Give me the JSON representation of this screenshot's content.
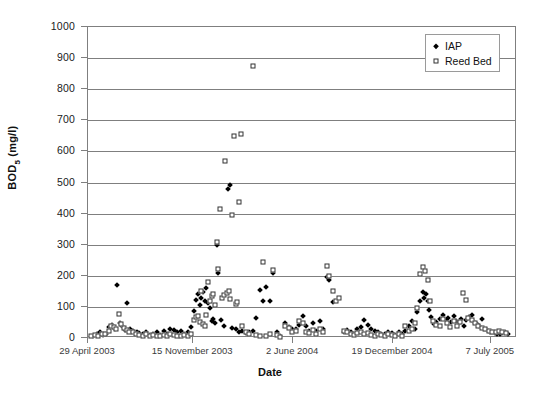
{
  "chart_data": {
    "type": "scatter",
    "title": "",
    "xlabel": "Date",
    "ylabel": "BOD5 (mg/l)",
    "ylabel_base": "BOD",
    "ylabel_sub": "5",
    "ylabel_units": " (mg/l)",
    "grid": true,
    "legend_position": "top-right",
    "ylim": [
      0,
      1000
    ],
    "ytick_step": 100,
    "yticks": [
      0,
      100,
      200,
      300,
      400,
      500,
      600,
      700,
      800,
      900,
      1000
    ],
    "xticks": [
      "29 April 2003",
      "15 November 2003",
      "2 June 2004",
      "19 December 2004",
      "7 July 2005"
    ],
    "xtick_positions": [
      0,
      0.245,
      0.478,
      0.711,
      0.939
    ],
    "xlim_labels": [
      "29 April 2003",
      "7 July 2005"
    ],
    "series": [
      {
        "name": "IAP",
        "marker": "filled-diamond",
        "color": "#000000",
        "points": [
          [
            0.012,
            8
          ],
          [
            0.02,
            14
          ],
          [
            0.028,
            20
          ],
          [
            0.034,
            10
          ],
          [
            0.042,
            12
          ],
          [
            0.05,
            35
          ],
          [
            0.056,
            42
          ],
          [
            0.062,
            30
          ],
          [
            0.068,
            172
          ],
          [
            0.074,
            48
          ],
          [
            0.08,
            38
          ],
          [
            0.086,
            25
          ],
          [
            0.092,
            112
          ],
          [
            0.098,
            28
          ],
          [
            0.106,
            22
          ],
          [
            0.114,
            18
          ],
          [
            0.12,
            15
          ],
          [
            0.128,
            12
          ],
          [
            0.136,
            20
          ],
          [
            0.144,
            10
          ],
          [
            0.152,
            14
          ],
          [
            0.16,
            18
          ],
          [
            0.168,
            9
          ],
          [
            0.176,
            22
          ],
          [
            0.184,
            12
          ],
          [
            0.192,
            30
          ],
          [
            0.2,
            25
          ],
          [
            0.208,
            18
          ],
          [
            0.216,
            22
          ],
          [
            0.224,
            14
          ],
          [
            0.232,
            20
          ],
          [
            0.24,
            35
          ],
          [
            0.248,
            88
          ],
          [
            0.252,
            122
          ],
          [
            0.256,
            140
          ],
          [
            0.26,
            105
          ],
          [
            0.264,
            128
          ],
          [
            0.268,
            148
          ],
          [
            0.272,
            118
          ],
          [
            0.276,
            160
          ],
          [
            0.28,
            112
          ],
          [
            0.284,
            95
          ],
          [
            0.288,
            55
          ],
          [
            0.292,
            62
          ],
          [
            0.296,
            48
          ],
          [
            0.3,
            300
          ],
          [
            0.304,
            210
          ],
          [
            0.31,
            58
          ],
          [
            0.318,
            40
          ],
          [
            0.326,
            480
          ],
          [
            0.33,
            492
          ],
          [
            0.336,
            32
          ],
          [
            0.344,
            28
          ],
          [
            0.352,
            20
          ],
          [
            0.36,
            24
          ],
          [
            0.368,
            15
          ],
          [
            0.376,
            18
          ],
          [
            0.384,
            22
          ],
          [
            0.392,
            65
          ],
          [
            0.4,
            155
          ],
          [
            0.408,
            120
          ],
          [
            0.416,
            165
          ],
          [
            0.424,
            118
          ],
          [
            0.432,
            208
          ],
          [
            0.44,
            20
          ],
          [
            0.448,
            5
          ],
          [
            0.46,
            48
          ],
          [
            0.468,
            35
          ],
          [
            0.476,
            28
          ],
          [
            0.484,
            30
          ],
          [
            0.492,
            42
          ],
          [
            0.5,
            72
          ],
          [
            0.508,
            38
          ],
          [
            0.516,
            22
          ],
          [
            0.524,
            48
          ],
          [
            0.532,
            24
          ],
          [
            0.54,
            55
          ],
          [
            0.548,
            30
          ],
          [
            0.556,
            195
          ],
          [
            0.562,
            188
          ],
          [
            0.57,
            115
          ],
          [
            0.596,
            18
          ],
          [
            0.604,
            25
          ],
          [
            0.612,
            20
          ],
          [
            0.62,
            14
          ],
          [
            0.628,
            30
          ],
          [
            0.636,
            35
          ],
          [
            0.644,
            58
          ],
          [
            0.652,
            42
          ],
          [
            0.66,
            28
          ],
          [
            0.668,
            22
          ],
          [
            0.676,
            18
          ],
          [
            0.684,
            14
          ],
          [
            0.692,
            12
          ],
          [
            0.7,
            20
          ],
          [
            0.708,
            16
          ],
          [
            0.716,
            10
          ],
          [
            0.724,
            18
          ],
          [
            0.732,
            14
          ],
          [
            0.74,
            22
          ],
          [
            0.748,
            38
          ],
          [
            0.756,
            55
          ],
          [
            0.762,
            30
          ],
          [
            0.768,
            82
          ],
          [
            0.774,
            118
          ],
          [
            0.78,
            148
          ],
          [
            0.784,
            130
          ],
          [
            0.788,
            142
          ],
          [
            0.792,
            120
          ],
          [
            0.796,
            90
          ],
          [
            0.8,
            68
          ],
          [
            0.806,
            45
          ],
          [
            0.812,
            52
          ],
          [
            0.82,
            62
          ],
          [
            0.828,
            75
          ],
          [
            0.834,
            58
          ],
          [
            0.84,
            65
          ],
          [
            0.846,
            50
          ],
          [
            0.852,
            72
          ],
          [
            0.858,
            55
          ],
          [
            0.864,
            48
          ],
          [
            0.87,
            62
          ],
          [
            0.876,
            40
          ],
          [
            0.882,
            58
          ],
          [
            0.888,
            68
          ],
          [
            0.894,
            75
          ],
          [
            0.9,
            52
          ],
          [
            0.906,
            45
          ],
          [
            0.912,
            38
          ],
          [
            0.918,
            62
          ],
          [
            0.924,
            30
          ],
          [
            0.93,
            25
          ],
          [
            0.936,
            20
          ],
          [
            0.942,
            18
          ],
          [
            0.948,
            16
          ],
          [
            0.954,
            14
          ],
          [
            0.96,
            12
          ],
          [
            0.966,
            15
          ],
          [
            0.972,
            18
          ],
          [
            0.978,
            14
          ]
        ]
      },
      {
        "name": "Reed Bed",
        "marker": "open-square",
        "color": "#333333",
        "points": [
          [
            0.008,
            6
          ],
          [
            0.016,
            10
          ],
          [
            0.024,
            8
          ],
          [
            0.032,
            14
          ],
          [
            0.04,
            12
          ],
          [
            0.048,
            22
          ],
          [
            0.054,
            40
          ],
          [
            0.06,
            35
          ],
          [
            0.066,
            28
          ],
          [
            0.072,
            78
          ],
          [
            0.078,
            45
          ],
          [
            0.084,
            32
          ],
          [
            0.09,
            25
          ],
          [
            0.096,
            20
          ],
          [
            0.104,
            18
          ],
          [
            0.112,
            14
          ],
          [
            0.12,
            10
          ],
          [
            0.128,
            8
          ],
          [
            0.136,
            12
          ],
          [
            0.144,
            6
          ],
          [
            0.152,
            9
          ],
          [
            0.16,
            7
          ],
          [
            0.168,
            5
          ],
          [
            0.176,
            10
          ],
          [
            0.184,
            8
          ],
          [
            0.192,
            12
          ],
          [
            0.2,
            9
          ],
          [
            0.208,
            7
          ],
          [
            0.216,
            6
          ],
          [
            0.224,
            10
          ],
          [
            0.232,
            8
          ],
          [
            0.24,
            14
          ],
          [
            0.248,
            58
          ],
          [
            0.252,
            68
          ],
          [
            0.256,
            72
          ],
          [
            0.26,
            52
          ],
          [
            0.264,
            150
          ],
          [
            0.268,
            45
          ],
          [
            0.272,
            40
          ],
          [
            0.276,
            75
          ],
          [
            0.28,
            180
          ],
          [
            0.284,
            118
          ],
          [
            0.288,
            135
          ],
          [
            0.292,
            142
          ],
          [
            0.296,
            105
          ],
          [
            0.3,
            310
          ],
          [
            0.304,
            222
          ],
          [
            0.308,
            415
          ],
          [
            0.312,
            128
          ],
          [
            0.316,
            138
          ],
          [
            0.32,
            570
          ],
          [
            0.324,
            145
          ],
          [
            0.328,
            152
          ],
          [
            0.332,
            125
          ],
          [
            0.336,
            395
          ],
          [
            0.34,
            650
          ],
          [
            0.344,
            108
          ],
          [
            0.348,
            115
          ],
          [
            0.352,
            436
          ],
          [
            0.356,
            655
          ],
          [
            0.36,
            40
          ],
          [
            0.368,
            18
          ],
          [
            0.376,
            12
          ],
          [
            0.384,
            875
          ],
          [
            0.392,
            10
          ],
          [
            0.4,
            8
          ],
          [
            0.408,
            245
          ],
          [
            0.416,
            6
          ],
          [
            0.424,
            12
          ],
          [
            0.432,
            218
          ],
          [
            0.44,
            10
          ],
          [
            0.448,
            4
          ],
          [
            0.46,
            38
          ],
          [
            0.468,
            32
          ],
          [
            0.476,
            20
          ],
          [
            0.484,
            22
          ],
          [
            0.492,
            55
          ],
          [
            0.5,
            48
          ],
          [
            0.508,
            18
          ],
          [
            0.516,
            15
          ],
          [
            0.524,
            25
          ],
          [
            0.532,
            12
          ],
          [
            0.54,
            30
          ],
          [
            0.548,
            20
          ],
          [
            0.556,
            232
          ],
          [
            0.562,
            200
          ],
          [
            0.57,
            152
          ],
          [
            0.578,
            118
          ],
          [
            0.586,
            128
          ],
          [
            0.596,
            22
          ],
          [
            0.604,
            18
          ],
          [
            0.612,
            14
          ],
          [
            0.62,
            10
          ],
          [
            0.628,
            16
          ],
          [
            0.636,
            20
          ],
          [
            0.644,
            12
          ],
          [
            0.652,
            15
          ],
          [
            0.66,
            10
          ],
          [
            0.668,
            8
          ],
          [
            0.676,
            12
          ],
          [
            0.684,
            9
          ],
          [
            0.692,
            7
          ],
          [
            0.7,
            14
          ],
          [
            0.708,
            10
          ],
          [
            0.716,
            6
          ],
          [
            0.724,
            12
          ],
          [
            0.732,
            8
          ],
          [
            0.74,
            40
          ],
          [
            0.748,
            22
          ],
          [
            0.756,
            30
          ],
          [
            0.762,
            48
          ],
          [
            0.768,
            95
          ],
          [
            0.774,
            205
          ],
          [
            0.78,
            228
          ],
          [
            0.786,
            215
          ],
          [
            0.792,
            185
          ],
          [
            0.798,
            120
          ],
          [
            0.804,
            55
          ],
          [
            0.812,
            42
          ],
          [
            0.82,
            38
          ],
          [
            0.828,
            62
          ],
          [
            0.836,
            48
          ],
          [
            0.844,
            35
          ],
          [
            0.852,
            55
          ],
          [
            0.86,
            40
          ],
          [
            0.868,
            52
          ],
          [
            0.874,
            145
          ],
          [
            0.88,
            122
          ],
          [
            0.886,
            65
          ],
          [
            0.894,
            58
          ],
          [
            0.902,
            48
          ],
          [
            0.91,
            40
          ],
          [
            0.918,
            32
          ],
          [
            0.926,
            28
          ],
          [
            0.934,
            24
          ],
          [
            0.942,
            20
          ],
          [
            0.95,
            18
          ],
          [
            0.958,
            22
          ],
          [
            0.966,
            18
          ],
          [
            0.974,
            16
          ]
        ]
      }
    ]
  },
  "legend": {
    "entries": [
      {
        "label": "IAP",
        "marker": "filled-diamond"
      },
      {
        "label": "Reed Bed",
        "marker": "open-square"
      }
    ]
  },
  "axes": {
    "x_title": "Date",
    "y_title_base": "BOD",
    "y_title_sub": "5",
    "y_title_units": " (mg/l)"
  },
  "colors": {
    "grid": "#7f7f7f",
    "frame": "#7f7f7f",
    "iap": "#000000",
    "reed": "#333333",
    "text": "#111111",
    "background": "#ffffff"
  }
}
